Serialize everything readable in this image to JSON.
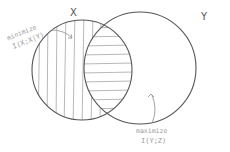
{
  "diagram": {
    "type": "venn",
    "sets": [
      {
        "id": "X",
        "label": "X",
        "cx": 82,
        "cy": 70,
        "r": 50
      },
      {
        "id": "Y",
        "label": "Y",
        "cx": 140,
        "cy": 68,
        "r": 56
      }
    ],
    "regions": [
      {
        "id": "x-only",
        "hatch": "vertical"
      },
      {
        "id": "x-and-y",
        "hatch": "horizontal"
      }
    ],
    "annotations": {
      "minimize": {
        "line1": "minimize",
        "line2": "I(X;X|Y)"
      },
      "maximize": {
        "line1": "maximize",
        "line2": "I(Y;Z)"
      }
    },
    "colors": {
      "outline": "#555555",
      "hatch": "#b0b0b0",
      "annotation": "#9a9a9a",
      "background": "#ffffff"
    }
  }
}
